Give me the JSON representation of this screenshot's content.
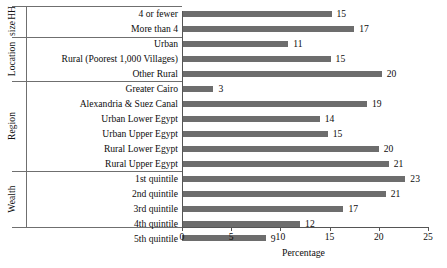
{
  "chart_data": {
    "type": "bar",
    "orientation": "horizontal",
    "title": "",
    "xlabel": "Percentage",
    "ylabel": "",
    "xlim": [
      0,
      25
    ],
    "xticks": [
      0,
      5,
      10,
      15,
      20,
      25
    ],
    "grid": false,
    "legend": null,
    "bar_color": "#6d6d6d",
    "groups": [
      {
        "name": "HH size",
        "name_lines": [
          "HH",
          "size"
        ],
        "categories": [
          "4 or fewer",
          "More than 4"
        ],
        "values": [
          15.2,
          17.5
        ],
        "labels": [
          "15",
          "17"
        ]
      },
      {
        "name": "Location",
        "name_lines": [
          "Location"
        ],
        "categories": [
          "Urban",
          "Rural (Poorest 1,000 Villages)",
          "Other Rural"
        ],
        "values": [
          10.8,
          15.1,
          20.3
        ],
        "labels": [
          "11",
          "15",
          "20"
        ]
      },
      {
        "name": "Region",
        "name_lines": [
          "Region"
        ],
        "categories": [
          "Greater Cairo",
          "Alexandria & Suez Canal",
          "Urban Lower Egypt",
          "Urban Upper Egypt",
          "Rural Lower Egypt",
          "Rural Upper Egypt"
        ],
        "values": [
          3.2,
          18.8,
          14.0,
          14.8,
          20.0,
          21.0
        ],
        "labels": [
          "3",
          "19",
          "14",
          "15",
          "20",
          "21"
        ]
      },
      {
        "name": "Wealth",
        "name_lines": [
          "Wealth"
        ],
        "categories": [
          "1st quintile",
          "2nd quintile",
          "3rd quintile",
          "4th quintile",
          "5th quintile"
        ],
        "values": [
          22.7,
          20.7,
          16.4,
          12.0,
          8.5
        ],
        "labels": [
          "23",
          "21",
          "17",
          "12",
          "9"
        ]
      }
    ],
    "categories": [
      "4 or fewer",
      "More than 4",
      "Urban",
      "Rural (Poorest 1,000 Villages)",
      "Other Rural",
      "Greater Cairo",
      "Alexandria & Suez Canal",
      "Urban Lower Egypt",
      "Urban Upper Egypt",
      "Rural Lower Egypt",
      "Rural Upper Egypt",
      "1st quintile",
      "2nd quintile",
      "3rd quintile",
      "4th quintile",
      "5th quintile"
    ],
    "values": [
      15.2,
      17.5,
      10.8,
      15.1,
      20.3,
      3.2,
      18.8,
      14.0,
      14.8,
      20.0,
      21.0,
      22.7,
      20.7,
      16.4,
      12.0,
      8.5
    ],
    "value_labels": [
      "15",
      "17",
      "11",
      "15",
      "20",
      "3",
      "19",
      "14",
      "15",
      "20",
      "21",
      "23",
      "21",
      "17",
      "12",
      "9"
    ]
  }
}
